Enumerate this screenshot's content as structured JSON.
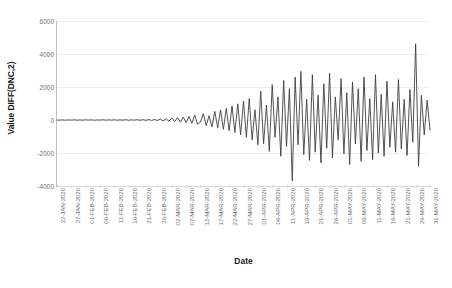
{
  "chart_data": {
    "type": "line",
    "title": "",
    "xlabel": "Date",
    "ylabel": "Value DIFF(DNC,2)",
    "ylim": [
      -4000,
      6000
    ],
    "yticks": [
      6000,
      4000,
      2000,
      0,
      -2000,
      -4000
    ],
    "ytick_labels": [
      "6000",
      "4000",
      "2000",
      "0",
      "-2000",
      "-4000"
    ],
    "grid": true,
    "legend": false,
    "line_color": "#404040",
    "line_width": 0.9,
    "background_color": "#ffffff",
    "gridline_color": "#eceff1",
    "axis_color": "#bfbfbf",
    "x_tick_labels": [
      "22-JAN-2020",
      "27-JAN-2020",
      "01-FEB-2020",
      "06-FEB-2020",
      "11-FEB-2020",
      "16-FEB-2020",
      "21-FEB-2020",
      "26-FEB-2020",
      "02-MAR-2020",
      "07-MAR-2020",
      "12-MAR-2020",
      "17-MAR-2020",
      "22-MAR-2020",
      "27-MAR-2020",
      "01-APR-2020",
      "06-APR-2020",
      "11-APR-2020",
      "16-APR-2020",
      "21-APR-2020",
      "26-APR-2020",
      "01-MAY-2020",
      "06-MAY-2020",
      "11-MAY-2020",
      "16-MAY-2020",
      "21-MAY-2020",
      "26-MAY-2020",
      "31-MAY-2020"
    ],
    "x_tick_interval_days": 5,
    "x_start": "22-JAN-2020",
    "x_end": "31-MAY-2020",
    "n_points": 131,
    "series": [
      {
        "name": "DIFF(DNC,2)",
        "values": [
          0,
          -5,
          8,
          -10,
          6,
          -4,
          12,
          -9,
          5,
          -7,
          10,
          -6,
          9,
          -12,
          7,
          -5,
          14,
          -11,
          8,
          -6,
          16,
          -13,
          11,
          -9,
          18,
          -15,
          13,
          -10,
          20,
          -17,
          25,
          -22,
          30,
          -26,
          35,
          -30,
          60,
          -55,
          80,
          -70,
          120,
          -100,
          150,
          -130,
          180,
          -160,
          220,
          -200,
          300,
          -260,
          -120,
          380,
          -340,
          260,
          -420,
          520,
          -470,
          610,
          -560,
          700,
          -640,
          840,
          -760,
          980,
          -900,
          1150,
          -1050,
          1300,
          -1200,
          620,
          -1500,
          1750,
          -1450,
          900,
          -1900,
          2150,
          -1050,
          1400,
          -2200,
          2400,
          -1600,
          1900,
          -3700,
          2600,
          -1500,
          2950,
          -2100,
          1250,
          -2450,
          2750,
          -1950,
          1500,
          -2600,
          2200,
          -1700,
          2850,
          -2300,
          1400,
          -1200,
          2500,
          -2050,
          1650,
          -2700,
          2300,
          -1450,
          1900,
          -2500,
          2600,
          -1850,
          1300,
          -2400,
          2750,
          -2000,
          1550,
          -2200,
          2350,
          -1650,
          1100,
          -1950,
          2450,
          -1750,
          1250,
          -2150,
          1850,
          -1350,
          4620,
          -2800,
          1500,
          -900,
          1200,
          -600
        ]
      }
    ]
  },
  "axes": {
    "y_title": "Value DIFF(DNC,2)",
    "x_title": "Date"
  }
}
